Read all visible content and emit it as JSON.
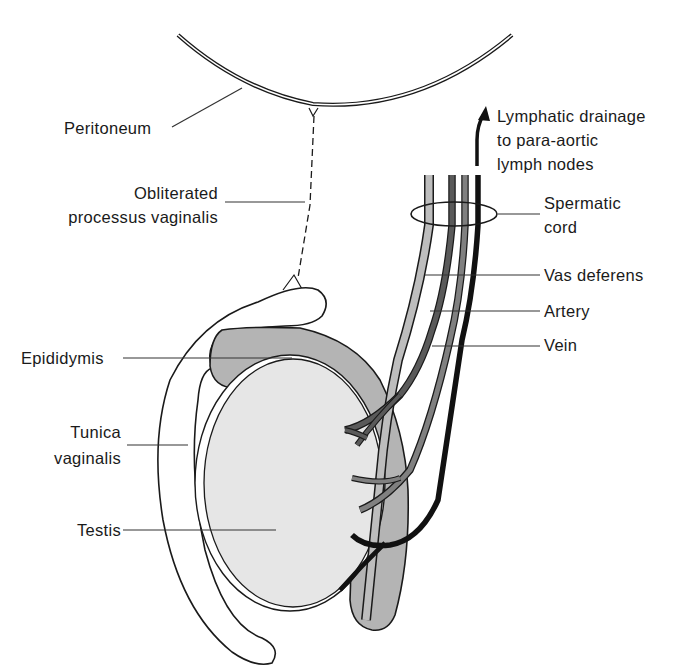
{
  "figure": {
    "type": "anatomical diagram"
  },
  "colors": {
    "outline": "#1a1a1a",
    "testis_fill": "#e6e6e6",
    "epididymis_fill": "#b4b4b4",
    "vas_deferens": "#bdbdbd",
    "artery": "#5a5a5a",
    "artery2": "#808080",
    "vein": "#111111",
    "background": "#ffffff"
  },
  "labels": {
    "peritoneum": "Peritoneum",
    "processus_line1": "Obliterated",
    "processus_line2": "processus vaginalis",
    "lymph_line1": "Lymphatic drainage",
    "lymph_line2": "to para-aortic",
    "lymph_line3": "lymph nodes",
    "spermatic_line1": "Spermatic",
    "spermatic_line2": "cord",
    "vas_deferens": "Vas deferens",
    "artery": "Artery",
    "vein": "Vein",
    "epididymis": "Epididymis",
    "tunica_line1": "Tunica",
    "tunica_line2": "vaginalis",
    "testis": "Testis"
  }
}
